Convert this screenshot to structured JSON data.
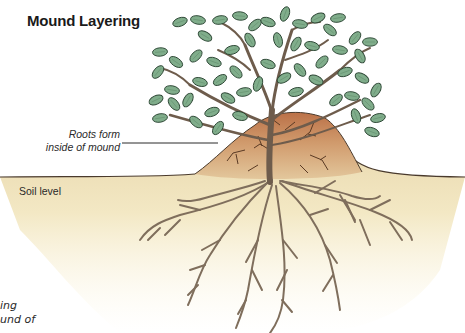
{
  "title": "Mound Layering",
  "labels": {
    "roots_callout_line1": "Roots form",
    "roots_callout_line2": "inside of mound",
    "soil_level": "Soil level"
  },
  "cutoff_text": {
    "line1": "ing",
    "line2": "und of"
  },
  "colors": {
    "leaf_fill": "#7fae8a",
    "leaf_stroke": "#2f4a36",
    "branch": "#6b5a4a",
    "mound_top": "#c07a50",
    "mound_base": "#dcb48a",
    "soil": "#efe0b4",
    "soil_fade": "#fbf6e4",
    "root": "#8a7a66"
  }
}
